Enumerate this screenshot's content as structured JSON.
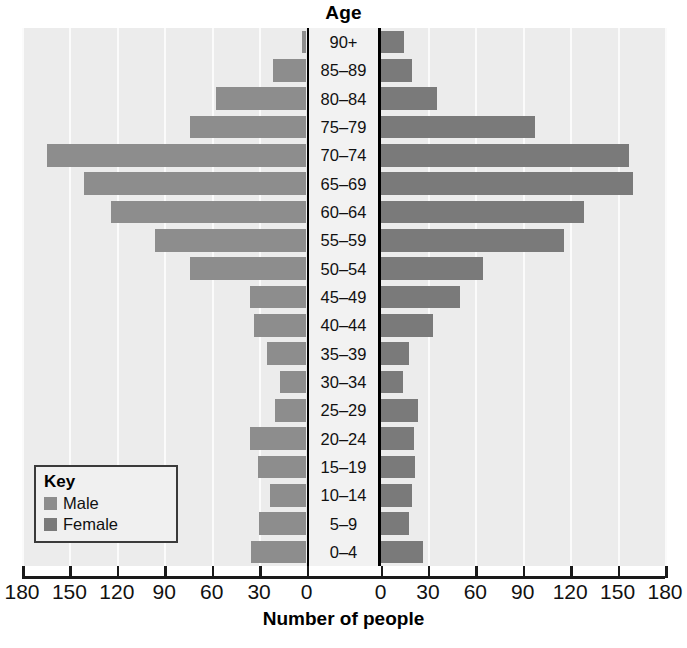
{
  "chart_title": "Age",
  "axis": {
    "x_title": "Number of people",
    "x_ticks_left": [
      180,
      150,
      120,
      90,
      60,
      30,
      0
    ],
    "x_ticks_right": [
      0,
      30,
      60,
      90,
      120,
      150,
      180
    ],
    "x_max": 180,
    "x_tick_step": 30
  },
  "key": {
    "title": "Key",
    "items": [
      {
        "label": "Male",
        "color": "#8d8d8d"
      },
      {
        "label": "Female",
        "color": "#7a7a7a"
      }
    ]
  },
  "colors": {
    "male": "#8d8d8d",
    "female": "#7a7a7a",
    "plot_background": "#ececec",
    "gridline": "#fbfbfb",
    "label_band": "#f2f2f2",
    "axis": "#000000"
  },
  "chart_data": {
    "type": "bar",
    "subtype": "population-pyramid",
    "title": "Age",
    "xlabel": "Number of people",
    "ylabel": "Age",
    "xlim": [
      0,
      180
    ],
    "grid": true,
    "legend_position": "bottom-left",
    "orientation": "horizontal",
    "categories": [
      "90+",
      "85–89",
      "80–84",
      "75–79",
      "70–74",
      "65–69",
      "60–64",
      "55–59",
      "50–54",
      "45–49",
      "40–44",
      "35–39",
      "30–34",
      "25–29",
      "20–24",
      "15–19",
      "10–14",
      "5–9",
      "0–4"
    ],
    "series": [
      {
        "name": "Male",
        "side": "left",
        "color": "#8d8d8d",
        "values": [
          3,
          21,
          57,
          74,
          164,
          141,
          124,
          96,
          74,
          36,
          33,
          25,
          17,
          20,
          36,
          31,
          23,
          30,
          35
        ]
      },
      {
        "name": "Female",
        "side": "right",
        "color": "#7a7a7a",
        "values": [
          15,
          20,
          36,
          98,
          157,
          160,
          129,
          116,
          65,
          50,
          33,
          18,
          14,
          24,
          21,
          22,
          20,
          18,
          27
        ]
      }
    ]
  }
}
